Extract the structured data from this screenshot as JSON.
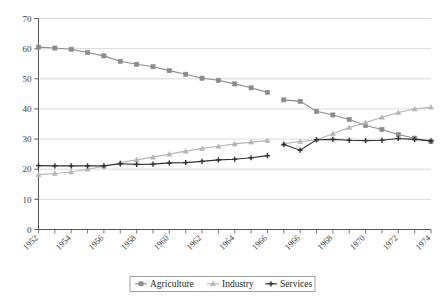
{
  "chart_data": {
    "type": "line",
    "title": "",
    "subtitle": "",
    "xlabel": "",
    "ylabel": "",
    "ylim": [
      0,
      70
    ],
    "ytick_values": [
      0,
      10,
      20,
      30,
      40,
      50,
      60,
      70
    ],
    "ytick_labels": [
      "0",
      "10",
      "20",
      "30",
      "40",
      "50",
      "60",
      "70"
    ],
    "grid": "horizontal",
    "legend_position": "bottom-center",
    "xtick_labels": [
      "1952",
      "1954",
      "1956",
      "1958",
      "1960",
      "1962",
      "1964",
      "1966",
      "1966",
      "1968",
      "1970",
      "1972",
      "1974"
    ],
    "x_all_years": [
      1952,
      1953,
      1954,
      1955,
      1956,
      1957,
      1958,
      1959,
      1960,
      1961,
      1962,
      1963,
      1964,
      1965,
      1966,
      1966,
      1967,
      1968,
      1969,
      1970,
      1971,
      1972,
      1973,
      1974,
      1975
    ],
    "has_series_break": true,
    "break_after_index": 14,
    "series": [
      {
        "name": "Agriculture",
        "color": "#8c8c8c",
        "marker": "square",
        "segments": [
          {
            "x": [
              1952,
              1953,
              1954,
              1955,
              1956,
              1957,
              1958,
              1959,
              1960,
              1961,
              1962,
              1963,
              1964,
              1965,
              1966
            ],
            "values": [
              60.5,
              60.2,
              59.8,
              58.7,
              57.6,
              55.8,
              54.8,
              54.0,
              52.7,
              51.5,
              50.2,
              49.5,
              48.3,
              47.0,
              45.5
            ]
          },
          {
            "x": [
              1966,
              1967,
              1968,
              1969,
              1970,
              1971,
              1972,
              1973,
              1974,
              1975
            ],
            "values": [
              43.0,
              42.5,
              39.2,
              38.0,
              36.5,
              34.5,
              33.2,
              31.5,
              30.3,
              29.2
            ]
          }
        ]
      },
      {
        "name": "Industry",
        "color": "#b5b5b5",
        "marker": "triangle",
        "segments": [
          {
            "x": [
              1952,
              1953,
              1954,
              1955,
              1956,
              1957,
              1958,
              1959,
              1960,
              1961,
              1962,
              1963,
              1964,
              1965,
              1966
            ],
            "values": [
              18.2,
              18.6,
              19.1,
              20.0,
              21.0,
              22.2,
              23.1,
              24.0,
              25.0,
              26.0,
              26.9,
              27.6,
              28.4,
              29.0,
              29.5
            ]
          },
          {
            "x": [
              1966,
              1967,
              1968,
              1969,
              1970,
              1971,
              1972,
              1973,
              1974,
              1975
            ],
            "values": [
              28.5,
              29.2,
              29.8,
              31.8,
              33.8,
              35.5,
              37.2,
              38.8,
              40.0,
              40.6
            ]
          }
        ]
      },
      {
        "name": "Services",
        "color": "#303030",
        "marker": "cross",
        "segments": [
          {
            "x": [
              1952,
              1953,
              1954,
              1955,
              1956,
              1957,
              1958,
              1959,
              1960,
              1961,
              1962,
              1963,
              1964,
              1965,
              1966
            ],
            "values": [
              21.2,
              21.1,
              21.1,
              21.1,
              21.1,
              21.8,
              21.6,
              21.7,
              22.1,
              22.2,
              22.6,
              23.1,
              23.3,
              23.8,
              24.5
            ]
          },
          {
            "x": [
              1966,
              1967,
              1968,
              1969,
              1970,
              1971,
              1972,
              1973,
              1974,
              1975
            ],
            "values": [
              28.2,
              26.3,
              29.8,
              29.9,
              29.6,
              29.5,
              29.6,
              30.2,
              29.9,
              29.4
            ]
          }
        ]
      }
    ],
    "legend": [
      {
        "label": "Agriculture",
        "color": "#8c8c8c",
        "marker": "square"
      },
      {
        "label": "Industry",
        "color": "#b5b5b5",
        "marker": "triangle"
      },
      {
        "label": "Services",
        "color": "#303030",
        "marker": "cross"
      }
    ]
  }
}
